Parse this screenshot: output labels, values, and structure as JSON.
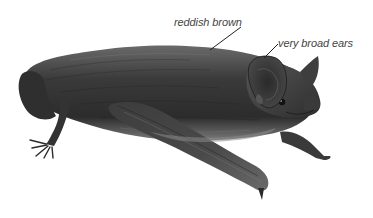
{
  "image": {
    "subject": "bat illustration",
    "style": "greyscale pencil drawing"
  },
  "annotations": [
    {
      "text": "reddish brown",
      "target": "fur on back"
    },
    {
      "text": "very broad ears",
      "target": "ear"
    }
  ],
  "colors": {
    "background": "#ffffff",
    "label_text": "#444444",
    "leader_line": "#222222",
    "fur_dark": "#2a2a2a",
    "fur_mid": "#555555",
    "fur_light": "#8a8a8a"
  }
}
